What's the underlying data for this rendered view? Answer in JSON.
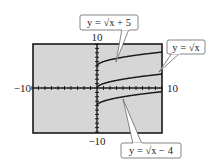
{
  "chart_data": {
    "type": "line",
    "title": "",
    "xlabel": "",
    "ylabel": "",
    "xlim": [
      -10,
      10
    ],
    "ylim": [
      -10,
      10
    ],
    "grid": false,
    "tick_labels": {
      "x_min": "−10",
      "x_max": "10",
      "y_min": "−10",
      "y_max": "10"
    },
    "series": [
      {
        "name": "y = √x + 5",
        "x": [
          0,
          1,
          2,
          4,
          6,
          8,
          10
        ],
        "values": [
          5,
          6,
          6.41,
          7,
          7.45,
          7.83,
          8.16
        ]
      },
      {
        "name": "y = √x",
        "x": [
          0,
          1,
          2,
          4,
          6,
          8,
          10
        ],
        "values": [
          0,
          1,
          1.41,
          2,
          2.45,
          2.83,
          3.16
        ]
      },
      {
        "name": "y = √x − 4",
        "x": [
          0,
          1,
          2,
          4,
          6,
          8,
          10
        ],
        "values": [
          -4,
          -3,
          -2.59,
          -2,
          -1.55,
          -1.17,
          -0.84
        ]
      }
    ],
    "annotations": [
      {
        "text": "y = √x + 5",
        "position": "top"
      },
      {
        "text": "y = √x",
        "position": "right"
      },
      {
        "text": "y = √x − 4",
        "position": "bottom-right"
      }
    ],
    "colors": {
      "screen_bg": "#d6d6d6",
      "frame": "#1a1a1a",
      "curve": "#1a1a1a",
      "callout_border": "#666666"
    }
  }
}
